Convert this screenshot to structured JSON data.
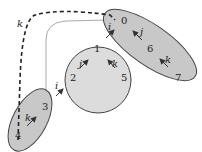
{
  "diagram": {
    "regions": [
      {
        "id": "top-right-ellipse",
        "fill": "#c8c8c8",
        "stroke": "#444444"
      },
      {
        "id": "center-circle",
        "fill": "#dcdcdc",
        "stroke": "#444444"
      },
      {
        "id": "bottom-left-ellipse",
        "fill": "#c8c8c8",
        "stroke": "#444444"
      }
    ],
    "nodes": {
      "n0": "0",
      "n1": "1",
      "n2": "2",
      "n3": "3",
      "n4": "4",
      "n5": "5",
      "n6": "6",
      "n7": "7"
    },
    "arrow_labels": {
      "dashed_k": "k",
      "circle_j": "j",
      "circle_k": "k",
      "ellipse_top_j": "j",
      "ellipse_top_k": "k",
      "ellipse_bottom_k": "k",
      "bridge_top_i": "i",
      "bridge_bottom_i": "i"
    },
    "colors": {
      "dashed_edge": "#222222",
      "thin_edge": "#aaaaaa",
      "arrow": "#333333"
    }
  }
}
